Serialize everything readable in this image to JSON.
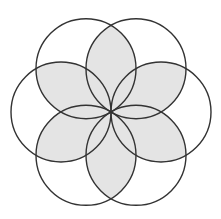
{
  "diagram": {
    "type": "six-circle rosette (seed of life petals)",
    "center": [
      111,
      112
    ],
    "radius": 50,
    "circle_count": 6,
    "circle_angles_deg": [
      0,
      60,
      120,
      180,
      240,
      300
    ],
    "shaded_lens_bisectors_deg": [
      30,
      90,
      150,
      210,
      270,
      330
    ],
    "colors": {
      "background": "#ffffff",
      "stroke": "#333333",
      "fill_shaded": "#e4e4e4"
    },
    "stroke_width": 1.4
  }
}
